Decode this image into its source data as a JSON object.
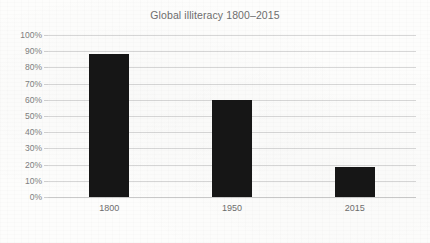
{
  "chart_data": {
    "type": "bar",
    "title": "Global illiteracy 1800–2015",
    "categories": [
      "1800",
      "1950",
      "2015"
    ],
    "values": [
      88,
      60,
      18.5
    ],
    "xlabel": "",
    "ylabel": "",
    "ylim": [
      0,
      100
    ],
    "y_ticks": [
      0,
      10,
      20,
      30,
      40,
      50,
      60,
      70,
      80,
      90,
      100
    ],
    "y_tick_labels": [
      "0%",
      "10%",
      "20%",
      "30%",
      "40%",
      "50%",
      "60%",
      "70%",
      "80%",
      "90%",
      "100%"
    ],
    "value_format": "percent",
    "grid": true,
    "grid_axis": "y",
    "legend": false,
    "legend_position": "none",
    "series": [
      {
        "name": "Global illiteracy",
        "values": [
          88,
          60,
          18.5
        ],
        "color": "#161616"
      }
    ],
    "colors": {
      "bar": "#161616",
      "gridline": "#d7d7d7",
      "axis": "#c9c9c9",
      "title_text": "#6e6e6e",
      "tick_text": "#808080",
      "background": "#fdfdfc"
    }
  }
}
